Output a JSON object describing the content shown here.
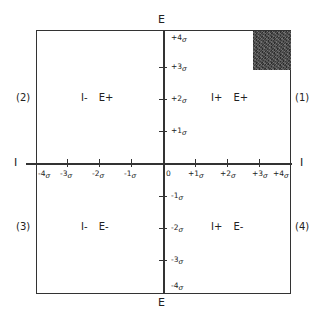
{
  "diagram": {
    "vertical_axis_title_top": "E",
    "vertical_axis_title_bottom": "E",
    "horizontal_axis_title_left": "I",
    "horizontal_axis_title_right": "I",
    "sigma_symbol": "σ",
    "origin_label": "0",
    "vertical_ticks": [
      {
        "label": "+4",
        "value": 4
      },
      {
        "label": "+3",
        "value": 3
      },
      {
        "label": "+2",
        "value": 2
      },
      {
        "label": "+1",
        "value": 1
      },
      {
        "label": "-1",
        "value": -1
      },
      {
        "label": "-2",
        "value": -2
      },
      {
        "label": "-3",
        "value": -3
      },
      {
        "label": "-4",
        "value": -4
      }
    ],
    "horizontal_ticks": [
      {
        "label": "-4",
        "value": -4
      },
      {
        "label": "-3",
        "value": -3
      },
      {
        "label": "-2",
        "value": -2
      },
      {
        "label": "-1",
        "value": -1
      },
      {
        "label": "+1",
        "value": 1
      },
      {
        "label": "+2",
        "value": 2
      },
      {
        "label": "+3",
        "value": 3
      },
      {
        "label": "+4",
        "value": 4
      }
    ],
    "quadrants": {
      "q1": {
        "number": "(1)",
        "label": "I+ E+"
      },
      "q2": {
        "number": "(2)",
        "label": "I- E+"
      },
      "q3": {
        "number": "(3)",
        "label": "I- E-"
      },
      "q4": {
        "number": "(4)",
        "label": "I+ E-"
      }
    },
    "shaded_region": {
      "quadrant": "q1",
      "corner": "top-right",
      "color": "#3a3a3a"
    },
    "line_color": "#333333"
  }
}
